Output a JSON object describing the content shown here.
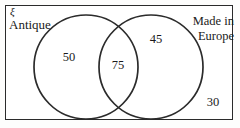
{
  "diagram": {
    "type": "venn-two-set",
    "universe_symbol": "ξ",
    "sets": [
      {
        "id": "left",
        "label": "Antique"
      },
      {
        "id": "right",
        "label_line1": "Made in",
        "label_line2": "Europe"
      }
    ],
    "regions": [
      {
        "id": "left-only",
        "value": "50"
      },
      {
        "id": "intersection",
        "value": "75"
      },
      {
        "id": "right-only",
        "value": "45"
      },
      {
        "id": "outside",
        "value": "30"
      }
    ],
    "colors": {
      "stroke": "#2b2b2b",
      "background": "#ffffff",
      "text": "#1a1a1a"
    }
  }
}
